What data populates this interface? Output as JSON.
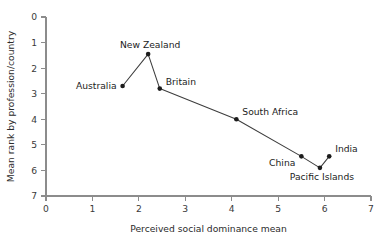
{
  "chart_data": {
    "type": "scatter",
    "title": "",
    "xlabel": "Perceived social dominance mean",
    "ylabel": "Mean rank by profession/country",
    "xlim": [
      0,
      7
    ],
    "ylim": [
      0,
      7
    ],
    "y_inverted": true,
    "grid": false,
    "legend": "none",
    "xticks": [
      "0",
      "1",
      "2",
      "3",
      "4",
      "5",
      "6",
      "7"
    ],
    "yticks": [
      "0",
      "1",
      "2",
      "3",
      "4",
      "5",
      "6",
      "7"
    ],
    "connected": true,
    "points": [
      {
        "label": "Australia",
        "x": 1.65,
        "y": 2.7,
        "label_pos": "left"
      },
      {
        "label": "New Zealand",
        "x": 2.2,
        "y": 1.45,
        "label_pos": "above"
      },
      {
        "label": "Britain",
        "x": 2.45,
        "y": 2.8,
        "label_pos": "upper-right"
      },
      {
        "label": "South Africa",
        "x": 4.1,
        "y": 4.0,
        "label_pos": "upper-right"
      },
      {
        "label": "China",
        "x": 5.5,
        "y": 5.45,
        "label_pos": "lower-left"
      },
      {
        "label": "Pacific Islands",
        "x": 5.9,
        "y": 5.9,
        "label_pos": "below"
      },
      {
        "label": "India",
        "x": 6.1,
        "y": 5.45,
        "label_pos": "upper-right"
      }
    ],
    "colors": {
      "marker": "#1c1c1c",
      "line": "#3d3d3d",
      "axis": "#8c8c8c",
      "text": "#1c1c1c",
      "background": "#ffffff"
    }
  }
}
